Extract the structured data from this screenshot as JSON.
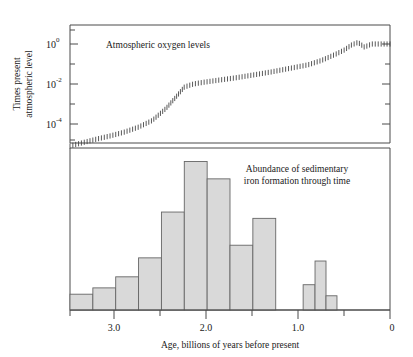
{
  "figure": {
    "title": "",
    "background": "#ffffff",
    "bar_fill": "#d9d9d9",
    "bar_stroke": "#666666",
    "line_color": "#3c3c3c"
  },
  "top_panel": {
    "annotation": "Atmospheric oxygen levels",
    "ylabel_line1": "Times present",
    "ylabel_line2": "atmospheric level",
    "ytick_labels": [
      "10",
      "10",
      "10"
    ],
    "ytick_exponents": [
      "0",
      "-2",
      "-4"
    ]
  },
  "bottom_panel": {
    "annotation_line1": "Abundance of sedimentary",
    "annotation_line2": "iron formation through time"
  },
  "xaxis": {
    "label": "Age, billions of years before present",
    "tick_labels": [
      "3.0",
      "2.0",
      "1.0",
      "0"
    ]
  },
  "chart_data": [
    {
      "type": "line",
      "title": "Atmospheric oxygen levels",
      "xlabel": "Age, billions of years before present",
      "ylabel": "Times present atmospheric level",
      "xlim": [
        3.5,
        0
      ],
      "ylim": [
        1e-05,
        5
      ],
      "yscale": "log",
      "xticks": [
        3.0,
        2.0,
        1.0,
        0
      ],
      "yticks": [
        1,
        0.01,
        0.0001
      ],
      "ytick_labels": [
        "10^0",
        "10^-2",
        "10^-4"
      ],
      "minor_yticks": [
        0.1,
        0.001,
        1e-05
      ],
      "grid": false,
      "legend": "none",
      "style": "hatched band",
      "series": [
        {
          "name": "Atmospheric oxygen levels",
          "x": [
            3.5,
            3.35,
            3.2,
            3.05,
            2.9,
            2.75,
            2.6,
            2.45,
            2.35,
            2.25,
            2.15,
            2.05,
            1.9,
            1.7,
            1.5,
            1.3,
            1.1,
            0.9,
            0.75,
            0.6,
            0.5,
            0.42,
            0.35,
            0.28,
            0.2,
            0.12,
            0.05,
            0.0
          ],
          "y": [
            8e-06,
            1.2e-05,
            1.8e-05,
            2.6e-05,
            4e-05,
            7e-05,
            0.00015,
            0.0006,
            0.002,
            0.007,
            0.01,
            0.012,
            0.015,
            0.02,
            0.028,
            0.04,
            0.06,
            0.09,
            0.15,
            0.3,
            0.5,
            0.9,
            1.2,
            0.7,
            1.0,
            1.0,
            1.0,
            1.0
          ]
        }
      ],
      "annotations": [
        {
          "text": "Atmospheric oxygen levels",
          "x": 3.0,
          "y": 1.0
        }
      ]
    },
    {
      "type": "bar",
      "title": "Abundance of sedimentary iron formation through time",
      "xlabel": "Age, billions of years before present",
      "ylabel": "",
      "xlim": [
        3.5,
        0
      ],
      "ylim": [
        0,
        1.0
      ],
      "xticks": [
        3.0,
        2.0,
        1.0,
        0
      ],
      "grid": false,
      "legend": "none",
      "bin_width": 0.25,
      "bin_centers": [
        3.375,
        3.125,
        2.875,
        2.625,
        2.375,
        2.125,
        1.875,
        1.625,
        1.375,
        0.875,
        0.75,
        0.625
      ],
      "bin_left_edges": [
        3.5,
        3.25,
        3.0,
        2.75,
        2.5,
        2.25,
        2.0,
        1.75,
        1.5,
        0.95,
        0.82,
        0.7
      ],
      "categories": [
        "3.50-3.25",
        "3.25-3.00",
        "3.00-2.75",
        "2.75-2.50",
        "2.50-2.25",
        "2.25-2.00",
        "2.00-1.75",
        "1.75-1.50",
        "1.50-1.25",
        "0.95-0.82",
        "0.82-0.70",
        "0.70-0.58"
      ],
      "values": [
        0.1,
        0.14,
        0.21,
        0.33,
        0.62,
        0.94,
        0.83,
        0.41,
        0.58,
        0.16,
        0.31,
        0.09
      ],
      "annotations": [
        {
          "text": "Abundance of sedimentary",
          "x": 1.95,
          "y": 0.9
        },
        {
          "text": "iron formation through time",
          "x": 1.95,
          "y": 0.8
        }
      ]
    }
  ]
}
